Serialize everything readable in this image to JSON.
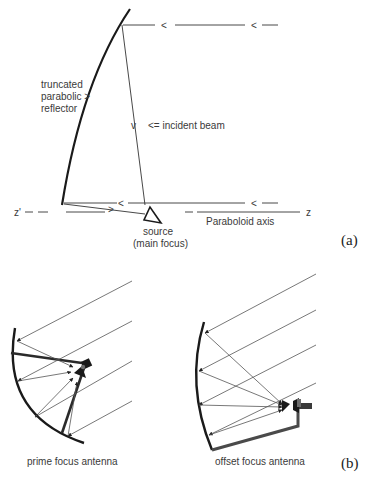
{
  "figure": {
    "panel_a": {
      "tag": "(a)",
      "labels": {
        "reflector_line1": "truncated",
        "reflector_line2": "parabolic  >",
        "reflector_line3": "reflector",
        "incident_beam": "<= incident beam",
        "source_line1": "source",
        "source_line2": "(main focus)",
        "axis": "Paraboloid axis",
        "z_prime": "z'",
        "z": "z"
      },
      "arrow_marks": {
        "left": "<",
        "right": ">",
        "down": "v"
      }
    },
    "panel_b": {
      "tag": "(b)",
      "left_label": "prime focus antenna",
      "right_label": "offset focus antenna"
    },
    "colors": {
      "ink": "#1a1a1a",
      "thin_ray": "#555555",
      "feed_gray": "#6e6e6e",
      "text": "#3a3a3a"
    }
  }
}
